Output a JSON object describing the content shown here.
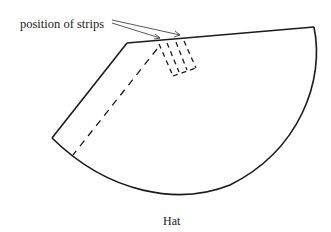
{
  "diagram": {
    "annotation": "position of strips",
    "caption": "Hat",
    "colors": {
      "stroke": "#1a1a1a",
      "arrow": "#444444"
    },
    "shape": "circular-sector-hat-pattern"
  }
}
